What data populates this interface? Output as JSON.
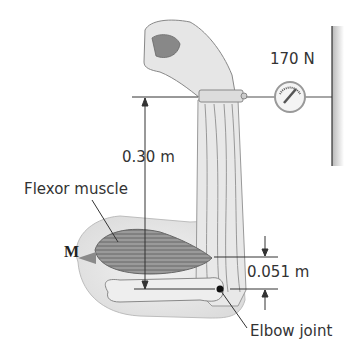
{
  "diagram": {
    "type": "biomechanics-free-body-illustration",
    "labels": {
      "force": "170 N",
      "lever_arm_hand": "0.30 m",
      "muscle": "Flexor muscle",
      "muscle_force": "M",
      "lever_arm_muscle": "0.051 m",
      "joint": "Elbow joint"
    },
    "colors": {
      "skin": "#e6e6e6",
      "muscle": "#8a8a8a",
      "lines": "#333333",
      "wall": "#9a9a9a"
    }
  }
}
